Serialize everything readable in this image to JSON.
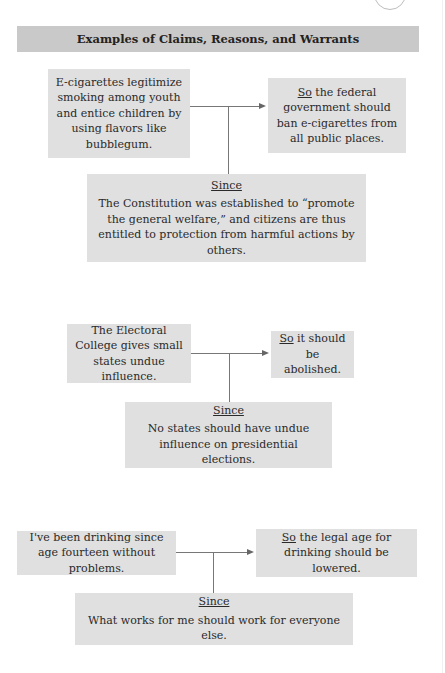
{
  "title": "Examples of Claims, Reasons, and Warrants",
  "diagrams": [
    {
      "reason": "E-cigarettes legitimize smoking among youth and entice children by using flavors like bubblegum.",
      "claim_keyword": "So",
      "claim": " the federal government should ban e-cigarettes from all public places.",
      "warrant_keyword": "Since",
      "warrant": "The Constitution was established to “promote the general welfare,” and citizens are thus entitled to protection from harmful actions by others."
    },
    {
      "reason": "The Electoral College gives small states undue influence.",
      "claim_keyword": "So",
      "claim": " it should be abolished.",
      "warrant_keyword": "Since",
      "warrant": "No states should have undue influence on presidential elections."
    },
    {
      "reason": "I've been drinking since age fourteen without problems.",
      "claim_keyword": "So",
      "claim": " the legal age for drinking should be lowered.",
      "warrant_keyword": "Since",
      "warrant": "What works for me should work for everyone else."
    }
  ],
  "colors": {
    "title_bar": "#c9c9c9",
    "box_fill": "#e0e0e0",
    "connector": "#777777"
  }
}
